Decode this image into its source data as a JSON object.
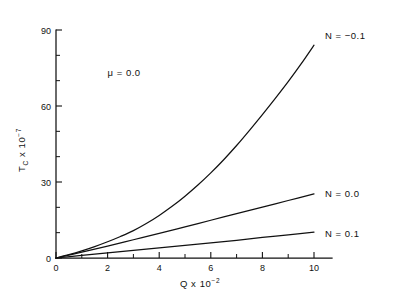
{
  "chart_data": {
    "type": "line",
    "title": "",
    "xlabel": "Q x 10-2",
    "xlabel_base": "Q  x  10",
    "xlabel_exp": "−2",
    "ylabel_base": "T",
    "ylabel_sub": "C",
    "ylabel_mid": "  x  10",
    "ylabel_exp": "−7",
    "xlim": [
      0,
      10
    ],
    "ylim": [
      0,
      90
    ],
    "xticks": [
      0,
      2,
      4,
      6,
      8,
      10
    ],
    "xtick_labels": [
      "0",
      "2",
      "4",
      "6",
      "8",
      "10"
    ],
    "xticks_minor": [
      1,
      3,
      5,
      7,
      9
    ],
    "yticks": [
      0,
      30,
      60,
      90
    ],
    "ytick_labels": [
      "0",
      "30",
      "60",
      "90"
    ],
    "yticks_minor": [
      10,
      20,
      40,
      50,
      70,
      80
    ],
    "grid": false,
    "legend_position": "inline-right-of-curves",
    "annotations": [
      {
        "text": "μ  =  0.0",
        "x": 2.0,
        "y": 72.0
      }
    ],
    "series": [
      {
        "name": "N = -0.1",
        "label": "N  =  −0.1",
        "label_x": 10.35,
        "label_y": 88.0,
        "x": [
          0,
          0.5,
          1,
          1.5,
          2,
          2.5,
          3,
          3.5,
          4,
          4.5,
          5,
          5.5,
          6,
          6.5,
          7,
          7.5,
          8,
          8.5,
          9,
          9.5,
          10
        ],
        "y": [
          0,
          1.3,
          2.8,
          4.5,
          6.4,
          8.5,
          10.8,
          13.6,
          16.8,
          20.4,
          24.4,
          28.8,
          33.6,
          38.8,
          44.4,
          50.4,
          56.6,
          63.0,
          69.6,
          76.6,
          84.0
        ]
      },
      {
        "name": "N = 0.0",
        "label": "N  =  0.0",
        "label_x": 10.35,
        "label_y": 25.5,
        "x": [
          0,
          1,
          2,
          3,
          4,
          5,
          6,
          7,
          8,
          9,
          10
        ],
        "y": [
          0,
          2.3,
          4.7,
          7.2,
          9.7,
          12.3,
          14.9,
          17.5,
          20.1,
          22.7,
          25.3
        ]
      },
      {
        "name": "N = 0.1",
        "label": "N  =  0.1",
        "label_x": 10.35,
        "label_y": 9.8,
        "x": [
          0,
          1,
          2,
          3,
          4,
          5,
          6,
          7,
          8,
          9,
          10
        ],
        "y": [
          0,
          1.0,
          2.0,
          3.0,
          4.0,
          5.0,
          6.0,
          7.0,
          8.1,
          9.1,
          10.2
        ]
      }
    ]
  },
  "colors": {
    "line": "#111111",
    "background": "#ffffff"
  }
}
